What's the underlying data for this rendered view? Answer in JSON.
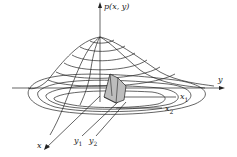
{
  "figure": {
    "labels": {
      "p_axis": "p(x, y)",
      "y_axis": "y",
      "x_axis": "x",
      "x1": "x",
      "x1_sub": "1",
      "x2": "x",
      "x2_sub": "2",
      "y1": "y",
      "y1_sub": "1",
      "y2": "y",
      "y2_sub": "2"
    },
    "colors": {
      "line": "#222222",
      "shade": "#bdbdbd",
      "background": "#ffffff"
    }
  }
}
